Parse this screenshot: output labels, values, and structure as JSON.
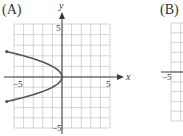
{
  "panels": [
    {
      "label": "(A)",
      "x_axis_label": "x",
      "y_axis_label": "y",
      "tick_labels": {
        "x_min": "−5",
        "x_max": "5",
        "y_max": "5",
        "y_min": "−5"
      }
    },
    {
      "label": "(B)",
      "tick_labels": {
        "x_min": "−5"
      }
    }
  ],
  "colors": {
    "grid": "#c9c9c9",
    "axis": "#3a3a3a",
    "curve": "#555555",
    "text": "#333333"
  },
  "chart_data": [
    {
      "type": "line",
      "title": "(A)",
      "xlabel": "x",
      "ylabel": "y",
      "xlim": [
        -5,
        5
      ],
      "ylim": [
        -5,
        5
      ],
      "grid": true,
      "x_ticks_labeled": [
        -5,
        5
      ],
      "y_ticks_labeled": [
        -5,
        5
      ],
      "series": [
        {
          "name": "x = -y^2",
          "points": [
            [
              -5.76,
              2.4
            ],
            [
              -4.0,
              2.0
            ],
            [
              -2.25,
              1.5
            ],
            [
              -1.0,
              1.0
            ],
            [
              -0.25,
              0.5
            ],
            [
              0,
              0
            ],
            [
              -0.25,
              -0.5
            ],
            [
              -1.0,
              -1.0
            ],
            [
              -2.25,
              -1.5
            ],
            [
              -4.0,
              -2.0
            ],
            [
              -5.76,
              -2.4
            ]
          ],
          "endpoints_marked": true
        }
      ]
    },
    {
      "type": "line",
      "title": "(B)",
      "xlim": [
        -5,
        5
      ],
      "ylim": [
        -5,
        5
      ],
      "grid": true,
      "x_ticks_labeled": [
        -5
      ],
      "series": [],
      "note": "panel cropped at right edge; only left portion visible"
    }
  ]
}
